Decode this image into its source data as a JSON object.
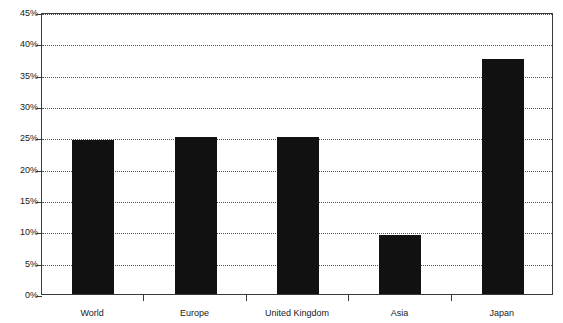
{
  "chart_data": {
    "type": "bar",
    "title": "",
    "subtitle": "",
    "xlabel": "",
    "ylabel": "",
    "categories": [
      "World",
      "Europe",
      "United Kingdom",
      "Asia",
      "Japan"
    ],
    "values": [
      24.6,
      25.0,
      25.1,
      9.4,
      37.5
    ],
    "series": [
      {
        "name": "",
        "values": [
          24.6,
          25.0,
          25.1,
          9.4,
          37.5
        ]
      }
    ],
    "ylim": [
      0,
      45
    ],
    "ytick_values": [
      0,
      5,
      10,
      15,
      20,
      25,
      30,
      35,
      40,
      45
    ],
    "ytick_labels": [
      "0%",
      "5%",
      "10%",
      "15%",
      "20%",
      "25%",
      "30%",
      "35%",
      "40%",
      "45%"
    ],
    "grid": true,
    "grid_axis": "y",
    "grid_style": "dotted",
    "legend": false,
    "legend_position": "none",
    "bar_color": "#111111",
    "axis_color": "#3a3a3a",
    "grid_color": "#555555",
    "background_color": "#ffffff",
    "annotations": []
  }
}
